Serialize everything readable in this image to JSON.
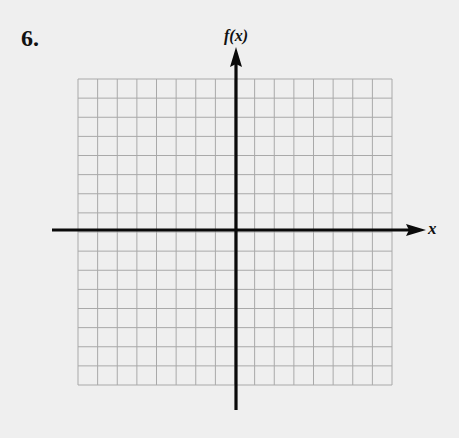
{
  "problem": {
    "number": "6."
  },
  "axes": {
    "y_label": "f(x)",
    "x_label": "x"
  },
  "grid": {
    "columns": 16,
    "rows": 16,
    "left": 78,
    "top": 79,
    "right": 392,
    "bottom": 385,
    "origin_x": 236,
    "origin_y": 230,
    "line_color": "#a9a9a9",
    "axis_color": "#0a0a0a",
    "background": "#efefef"
  }
}
